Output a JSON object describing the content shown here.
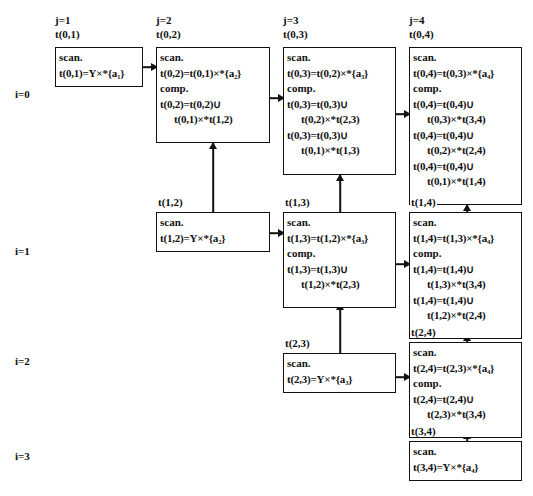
{
  "figure": {
    "caption": "",
    "column_headers": [
      {
        "j": "j=1",
        "t": "t(0,1)"
      },
      {
        "j": "j=2",
        "t": "t(0,2)"
      },
      {
        "j": "j=3",
        "t": "t(0,3)"
      },
      {
        "j": "j=4",
        "t": "t(0,4)"
      }
    ],
    "row_labels": [
      "i=0",
      "i=1",
      "i=2",
      "i=3"
    ]
  },
  "labels": {
    "t01": "t(0,1)",
    "t02": "t(0,2)",
    "t03": "t(0,3)",
    "t04": "t(0,4)",
    "t12": "t(1,2)",
    "t13": "t(1,3)",
    "t14": "t(1,4)",
    "t23": "t(2,3)",
    "t24": "t(2,4)",
    "t34": "t(3,4)"
  },
  "keywords": {
    "scan": "scan.",
    "comp": "comp."
  },
  "cells": {
    "c01": {
      "name": "t(0,1)",
      "lines": [
        "scan.",
        "t(0,1)=Y×*{a₁}"
      ]
    },
    "c02": {
      "name": "t(0,2)",
      "lines": [
        "scan.",
        "t(0,2)=t(0,1)×*{a₂}",
        "comp.",
        "t(0,2)=t(0,2)∪",
        "t(0,1)×*t(1,2)"
      ]
    },
    "c03": {
      "name": "t(0,3)",
      "lines": [
        "scan.",
        "t(0,3)=t(0,2)×*{a₃}",
        "comp.",
        "t(0,3)=t(0,3)∪",
        "t(0,2)×*t(2,3)",
        "t(0,3)=t(0,3)∪",
        "t(0,1)×*t(1,3)"
      ]
    },
    "c04": {
      "name": "t(0,4)",
      "lines": [
        "scan.",
        "t(0,4)=t(0,3)×*{a₄}",
        "comp.",
        "t(0,4)=t(0,4)∪",
        "t(0,3)×*t(3,4)",
        "t(0,4)=t(0,4)∪",
        "t(0,2)×*t(2,4)",
        "t(0,4)=t(0,4)∪",
        "t(0,1)×*t(1,4)"
      ]
    },
    "c12": {
      "name": "t(1,2)",
      "lines": [
        "scan.",
        "t(1,2)=Y×*{a₂}"
      ]
    },
    "c13": {
      "name": "t(1,3)",
      "lines": [
        "scan.",
        "t(1,3)=t(1,2)×*{a₃}",
        "comp.",
        "t(1,3)=t(1,3)∪",
        "t(1,2)×*t(2,3)"
      ]
    },
    "c14": {
      "name": "t(1,4)",
      "lines": [
        "scan.",
        "t(1,4)=t(1,3)×*{a₄}",
        "comp.",
        "t(1,4)=t(1,4)∪",
        "t(1,3)×*t(3,4)",
        "t(1,4)=t(1,4)∪",
        "t(1,2)×*t(2,4)"
      ]
    },
    "c23": {
      "name": "t(2,3)",
      "lines": [
        "scan.",
        "t(2,3)=Y×*{a₃}"
      ]
    },
    "c24": {
      "name": "t(2,4)",
      "lines": [
        "scan.",
        "t(2,4)=t(2,3)×*{a₄}",
        "comp.",
        "t(2,4)=t(2,4)∪",
        "t(2,3)×*t(3,4)"
      ]
    },
    "c34": {
      "name": "t(3,4)",
      "lines": [
        "scan.",
        "t(3,4)=Y×*{a₄}"
      ]
    }
  }
}
